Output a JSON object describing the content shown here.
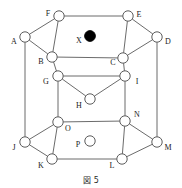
{
  "figure": {
    "caption": "図 5",
    "caption_label": "図",
    "caption_number": "5",
    "colors": {
      "edge": "#5a5a5a",
      "node_stroke": "#4a4a4a",
      "node_fill": "#ffffff",
      "marked_node_fill": "#000000",
      "background": "#ffffff",
      "label_text": "#1a1a1a"
    }
  },
  "diagram_data": {
    "type": "graph",
    "description": "Hexagonal prism lattice diagram with labeled vertices",
    "node_radius": 5.2,
    "marker_radius": 5.4,
    "nodes": [
      {
        "id": "A",
        "label": "A",
        "cx": 25,
        "cy": 37,
        "style": "open",
        "label_x": 14,
        "label_y": 42
      },
      {
        "id": "B",
        "label": "B",
        "cx": 52,
        "cy": 57,
        "style": "open",
        "label_x": 41,
        "label_y": 62
      },
      {
        "id": "C",
        "label": "C",
        "cx": 123,
        "cy": 58,
        "style": "open",
        "label_x": 113,
        "label_y": 63
      },
      {
        "id": "D",
        "label": "D",
        "cx": 157,
        "cy": 37,
        "style": "open",
        "label_x": 168,
        "label_y": 42
      },
      {
        "id": "E",
        "label": "E",
        "cx": 128,
        "cy": 16,
        "style": "open",
        "label_x": 139,
        "label_y": 15
      },
      {
        "id": "F",
        "label": "F",
        "cx": 59,
        "cy": 16,
        "style": "open",
        "label_x": 48,
        "label_y": 14
      },
      {
        "id": "G",
        "label": "G",
        "cx": 58,
        "cy": 76,
        "style": "open",
        "label_x": 46,
        "label_y": 82
      },
      {
        "id": "H",
        "label": "H",
        "cx": 90,
        "cy": 99,
        "style": "open",
        "label_x": 79,
        "label_y": 106
      },
      {
        "id": "I",
        "label": "I",
        "cx": 125,
        "cy": 76,
        "style": "open",
        "label_x": 137,
        "label_y": 82
      },
      {
        "id": "J",
        "label": "J",
        "cx": 25,
        "cy": 142,
        "style": "open",
        "label_x": 14,
        "label_y": 148
      },
      {
        "id": "K",
        "label": "K",
        "cx": 52,
        "cy": 159,
        "style": "open",
        "label_x": 41,
        "label_y": 166
      },
      {
        "id": "L",
        "label": "L",
        "cx": 122,
        "cy": 159,
        "style": "open",
        "label_x": 112,
        "label_y": 166
      },
      {
        "id": "M",
        "label": "M",
        "cx": 157,
        "cy": 142,
        "style": "open",
        "label_x": 168,
        "label_y": 148
      },
      {
        "id": "N",
        "label": "N",
        "cx": 125,
        "cy": 121,
        "style": "open",
        "label_x": 137,
        "label_y": 115
      },
      {
        "id": "O",
        "label": "O",
        "cx": 58,
        "cy": 122,
        "style": "open",
        "label_x": 68,
        "label_y": 129
      },
      {
        "id": "P",
        "label": "P",
        "cx": 90,
        "cy": 141,
        "style": "open",
        "label_x": 78,
        "label_y": 145
      },
      {
        "id": "X",
        "label": "X",
        "cx": 90,
        "cy": 36,
        "style": "filled",
        "label_x": 79,
        "label_y": 41
      }
    ],
    "edges": [
      {
        "from": "F",
        "to": "E"
      },
      {
        "from": "F",
        "to": "A"
      },
      {
        "from": "F",
        "to": "B"
      },
      {
        "from": "E",
        "to": "D"
      },
      {
        "from": "E",
        "to": "C"
      },
      {
        "from": "A",
        "to": "B"
      },
      {
        "from": "D",
        "to": "C"
      },
      {
        "from": "B",
        "to": "C"
      },
      {
        "from": "A",
        "to": "J"
      },
      {
        "from": "D",
        "to": "M"
      },
      {
        "from": "B",
        "to": "G"
      },
      {
        "from": "C",
        "to": "I"
      },
      {
        "from": "G",
        "to": "I"
      },
      {
        "from": "G",
        "to": "H"
      },
      {
        "from": "I",
        "to": "H"
      },
      {
        "from": "G",
        "to": "O"
      },
      {
        "from": "I",
        "to": "N"
      },
      {
        "from": "O",
        "to": "N"
      },
      {
        "from": "O",
        "to": "J"
      },
      {
        "from": "O",
        "to": "K"
      },
      {
        "from": "N",
        "to": "M"
      },
      {
        "from": "N",
        "to": "L"
      },
      {
        "from": "J",
        "to": "K"
      },
      {
        "from": "M",
        "to": "L"
      },
      {
        "from": "K",
        "to": "L"
      }
    ]
  }
}
